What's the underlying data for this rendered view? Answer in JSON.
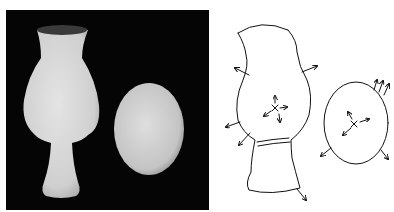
{
  "figure": {
    "panels": [
      {
        "id": "photo",
        "description": "Grayscale photograph of a white vase-shaped object and an egg on a black background",
        "objects": [
          "vase",
          "egg"
        ],
        "background_color": "#050505",
        "object_color": "#d8d8d8"
      },
      {
        "id": "sketch",
        "description": "Line drawing of the vase and egg with surface normal arrows and center-of-mass crosses",
        "objects": [
          "vase-outline",
          "egg-outline"
        ],
        "annotations": [
          "outward-normal-arrows",
          "center-cross-with-arrows"
        ],
        "stroke_color": "#111111"
      }
    ]
  }
}
